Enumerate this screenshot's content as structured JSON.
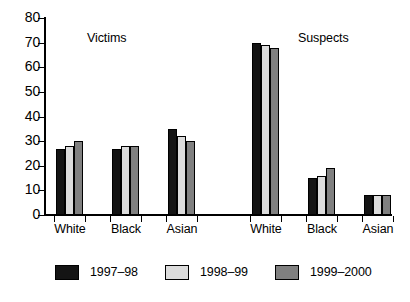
{
  "chart_data": {
    "type": "bar",
    "title": "",
    "subtitle": "",
    "xlabel": "",
    "ylabel": "",
    "ylim": [
      0,
      80
    ],
    "ytick_labels": [
      "0",
      "10",
      "20",
      "30",
      "40",
      "50",
      "60",
      "70",
      "80"
    ],
    "yticks": [
      0,
      10,
      20,
      30,
      40,
      50,
      60,
      70,
      80
    ],
    "grid": false,
    "legend_position": "bottom",
    "panels": [
      {
        "name": "Victims",
        "categories": [
          "White",
          "Black",
          "Asian"
        ],
        "series": [
          {
            "name": "1997-98",
            "values": [
              27,
              27,
              35
            ]
          },
          {
            "name": "1998-99",
            "values": [
              28,
              28,
              32
            ]
          },
          {
            "name": "1999-2000",
            "values": [
              30,
              28,
              30
            ]
          }
        ]
      },
      {
        "name": "Suspects",
        "categories": [
          "White",
          "Black",
          "Asian"
        ],
        "series": [
          {
            "name": "1997-98",
            "values": [
              70,
              15,
              8
            ]
          },
          {
            "name": "1998-99",
            "values": [
              69,
              16,
              8
            ]
          },
          {
            "name": "1999-2000",
            "values": [
              68,
              19,
              8
            ]
          }
        ]
      }
    ],
    "legend": [
      {
        "label": "1997–98",
        "color": "#141414"
      },
      {
        "label": "1998–99",
        "color": "#dcdcdc"
      },
      {
        "label": "1999–2000",
        "color": "#808080"
      }
    ],
    "series_colors": [
      "#141414",
      "#dcdcdc",
      "#808080"
    ],
    "axis_color": "#000000",
    "background_color": "#ffffff"
  },
  "panel_titles": {
    "victims": "Victims",
    "suspects": "Suspects"
  }
}
